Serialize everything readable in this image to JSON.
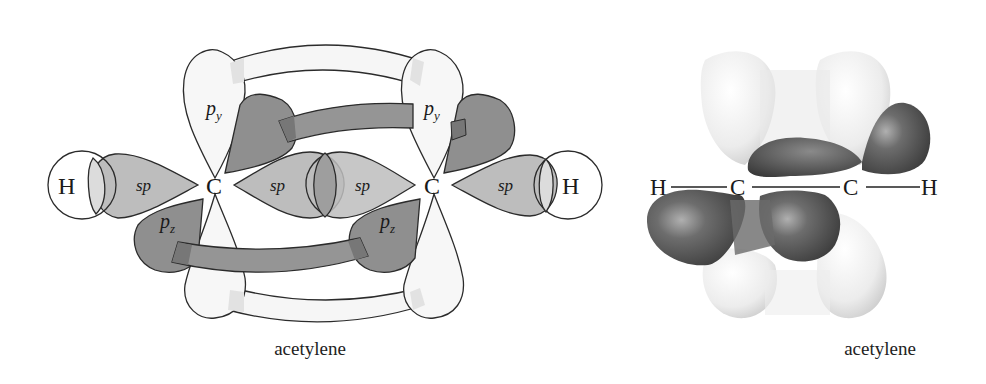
{
  "figure": {
    "left_panel": {
      "caption": "acetylene",
      "atoms": [
        {
          "symbol": "H",
          "position": "left"
        },
        {
          "symbol": "C",
          "position": "center-left"
        },
        {
          "symbol": "C",
          "position": "center-right"
        },
        {
          "symbol": "H",
          "position": "right"
        }
      ],
      "orbital_labels": {
        "sp": "sp",
        "py": "p",
        "py_sub": "y",
        "pz": "p",
        "pz_sub": "z"
      },
      "bonds": [
        "sigma H–C (s–sp)",
        "sigma C–C (sp–sp)",
        "pi (py–py)",
        "pi (pz–pz)",
        "sigma C–H (sp–s)"
      ]
    },
    "right_panel": {
      "caption": "acetylene",
      "atoms": [
        "H",
        "C",
        "C",
        "H"
      ],
      "description": "3D electron density rendering of two pi bonds"
    },
    "colors": {
      "light_lobe": "#f4f4f4",
      "sp_lobe": "#bdbdbd",
      "dark_lobe": "#8f8f8f",
      "overlap": "#a5a5a5",
      "outline": "#2b2b2b"
    }
  }
}
